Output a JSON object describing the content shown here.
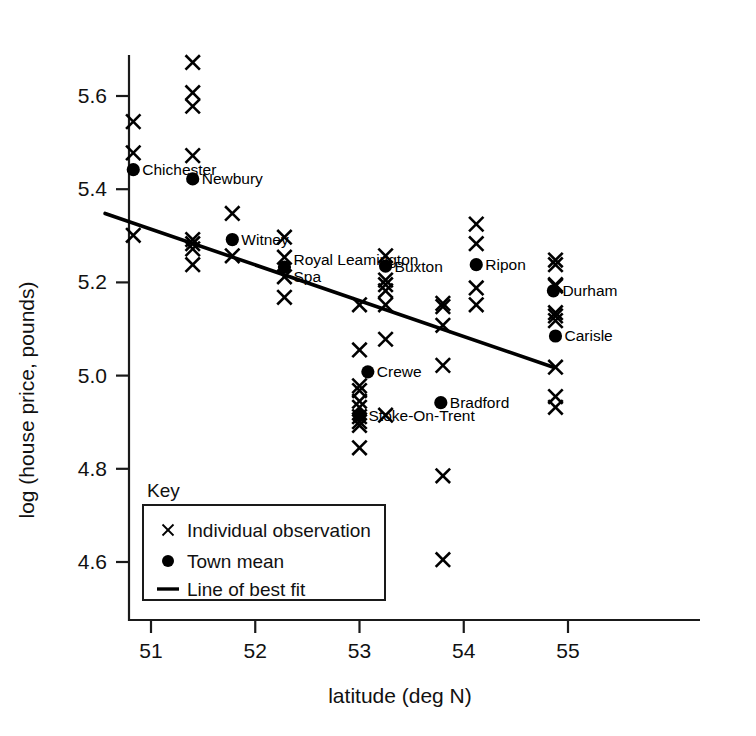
{
  "chart_data": {
    "type": "scatter",
    "title": "",
    "xlabel": "latitude (deg N)",
    "ylabel": "log (house price, pounds)",
    "xlim": [
      50.63,
      55.18
    ],
    "ylim": [
      4.55,
      5.72
    ],
    "xticks": [
      51,
      52,
      53,
      54,
      55
    ],
    "xticklabels": [
      "51",
      "52",
      "53",
      "54",
      "55"
    ],
    "yticks": [
      4.6,
      4.8,
      5.0,
      5.2,
      5.4,
      5.6
    ],
    "yticklabels": [
      "4.6",
      "4.8",
      "5.0",
      "5.2",
      "5.4",
      "5.6"
    ],
    "grid": false,
    "legend_position": "lower-left-inside",
    "series": [
      {
        "name": "Individual observation",
        "marker": "x",
        "points": [
          {
            "x": 50.83,
            "y": 5.545
          },
          {
            "x": 50.83,
            "y": 5.478
          },
          {
            "x": 50.83,
            "y": 5.301
          },
          {
            "x": 51.4,
            "y": 5.672
          },
          {
            "x": 51.4,
            "y": 5.607
          },
          {
            "x": 51.4,
            "y": 5.578
          },
          {
            "x": 51.4,
            "y": 5.472
          },
          {
            "x": 51.4,
            "y": 5.292
          },
          {
            "x": 51.4,
            "y": 5.283
          },
          {
            "x": 51.4,
            "y": 5.272
          },
          {
            "x": 51.4,
            "y": 5.238
          },
          {
            "x": 51.78,
            "y": 5.348
          },
          {
            "x": 51.78,
            "y": 5.257
          },
          {
            "x": 52.28,
            "y": 5.297
          },
          {
            "x": 52.28,
            "y": 5.254
          },
          {
            "x": 52.28,
            "y": 5.212
          },
          {
            "x": 52.28,
            "y": 5.168
          },
          {
            "x": 53.0,
            "y": 5.152
          },
          {
            "x": 53.0,
            "y": 5.055
          },
          {
            "x": 53.0,
            "y": 4.978
          },
          {
            "x": 53.0,
            "y": 4.968
          },
          {
            "x": 53.0,
            "y": 4.945
          },
          {
            "x": 53.0,
            "y": 4.932
          },
          {
            "x": 53.0,
            "y": 4.912
          },
          {
            "x": 53.0,
            "y": 4.901
          },
          {
            "x": 53.0,
            "y": 4.893
          },
          {
            "x": 53.0,
            "y": 4.845
          },
          {
            "x": 53.25,
            "y": 5.257
          },
          {
            "x": 53.25,
            "y": 5.205
          },
          {
            "x": 53.25,
            "y": 5.195
          },
          {
            "x": 53.25,
            "y": 5.182
          },
          {
            "x": 53.25,
            "y": 5.152
          },
          {
            "x": 53.25,
            "y": 5.078
          },
          {
            "x": 53.25,
            "y": 4.915
          },
          {
            "x": 53.8,
            "y": 5.155
          },
          {
            "x": 53.8,
            "y": 5.148
          },
          {
            "x": 53.8,
            "y": 5.108
          },
          {
            "x": 53.8,
            "y": 5.022
          },
          {
            "x": 53.8,
            "y": 4.785
          },
          {
            "x": 53.8,
            "y": 4.605
          },
          {
            "x": 54.12,
            "y": 5.325
          },
          {
            "x": 54.12,
            "y": 5.283
          },
          {
            "x": 54.12,
            "y": 5.188
          },
          {
            "x": 54.12,
            "y": 5.152
          },
          {
            "x": 54.88,
            "y": 5.248
          },
          {
            "x": 54.88,
            "y": 5.238
          },
          {
            "x": 54.88,
            "y": 5.195
          },
          {
            "x": 54.88,
            "y": 5.192
          },
          {
            "x": 54.88,
            "y": 5.135
          },
          {
            "x": 54.88,
            "y": 5.128
          },
          {
            "x": 54.88,
            "y": 5.118
          },
          {
            "x": 54.88,
            "y": 5.018
          },
          {
            "x": 54.88,
            "y": 4.955
          },
          {
            "x": 54.88,
            "y": 4.932
          }
        ]
      },
      {
        "name": "Town mean",
        "marker": "dot",
        "points": [
          {
            "x": 50.83,
            "y": 5.442,
            "label": "Chichester",
            "label_side": "right"
          },
          {
            "x": 51.4,
            "y": 5.422,
            "label": "Newbury",
            "label_side": "right"
          },
          {
            "x": 51.78,
            "y": 5.292,
            "label": "Witney",
            "label_side": "right"
          },
          {
            "x": 52.28,
            "y": 5.233,
            "label": "Royal Leamington Spa",
            "label_side": "right"
          },
          {
            "x": 53.0,
            "y": 4.915,
            "label": "Stoke-On-Trent",
            "label_side": "right"
          },
          {
            "x": 53.08,
            "y": 5.008,
            "label": "Crewe",
            "label_side": "right"
          },
          {
            "x": 53.25,
            "y": 5.235,
            "label": "Buxton",
            "label_side": "right"
          },
          {
            "x": 53.78,
            "y": 4.942,
            "label": "Bradford",
            "label_side": "right"
          },
          {
            "x": 54.12,
            "y": 5.238,
            "label": "Ripon",
            "label_side": "right"
          },
          {
            "x": 54.86,
            "y": 5.182,
            "label": "Durham",
            "label_side": "right"
          },
          {
            "x": 54.88,
            "y": 5.085,
            "label": "Carisle",
            "label_side": "right"
          }
        ]
      },
      {
        "name": "Line of best fit",
        "marker": "line",
        "endpoints": [
          {
            "x": 50.56,
            "y": 5.348
          },
          {
            "x": 54.86,
            "y": 5.018
          }
        ]
      }
    ]
  },
  "legend": {
    "title": "Key",
    "items": [
      {
        "symbol": "x-marker",
        "label": "Individual observation"
      },
      {
        "symbol": "dot-marker",
        "label": "Town mean"
      },
      {
        "symbol": "line-marker",
        "label": "Line of best fit"
      }
    ]
  }
}
